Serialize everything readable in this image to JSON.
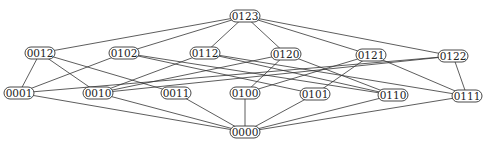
{
  "diagram": {
    "type": "hasse-diagram",
    "nodes": [
      {
        "id": "0123",
        "label": "0123",
        "x": 245,
        "y": 16
      },
      {
        "id": "0012",
        "label": "0012",
        "x": 40,
        "y": 53
      },
      {
        "id": "0102",
        "label": "0102",
        "x": 124,
        "y": 53
      },
      {
        "id": "0112",
        "label": "0112",
        "x": 205,
        "y": 53
      },
      {
        "id": "0120",
        "label": "0120",
        "x": 286,
        "y": 54
      },
      {
        "id": "0121",
        "label": "0121",
        "x": 371,
        "y": 55
      },
      {
        "id": "0122",
        "label": "0122",
        "x": 453,
        "y": 56
      },
      {
        "id": "0001",
        "label": "0001",
        "x": 19,
        "y": 93
      },
      {
        "id": "0010",
        "label": "0010",
        "x": 98,
        "y": 93
      },
      {
        "id": "0011",
        "label": "0011",
        "x": 176,
        "y": 93
      },
      {
        "id": "0100",
        "label": "0100",
        "x": 245,
        "y": 93
      },
      {
        "id": "0101",
        "label": "0101",
        "x": 315,
        "y": 94
      },
      {
        "id": "0110",
        "label": "0110",
        "x": 393,
        "y": 95
      },
      {
        "id": "0111",
        "label": "0111",
        "x": 467,
        "y": 96
      },
      {
        "id": "0000",
        "label": "0000",
        "x": 245,
        "y": 132
      }
    ],
    "edges": [
      [
        "0123",
        "0012"
      ],
      [
        "0123",
        "0102"
      ],
      [
        "0123",
        "0112"
      ],
      [
        "0123",
        "0120"
      ],
      [
        "0123",
        "0121"
      ],
      [
        "0123",
        "0122"
      ],
      [
        "0012",
        "0001"
      ],
      [
        "0012",
        "0010"
      ],
      [
        "0012",
        "0011"
      ],
      [
        "0102",
        "0001"
      ],
      [
        "0102",
        "0101"
      ],
      [
        "0102",
        "0110"
      ],
      [
        "0112",
        "0010"
      ],
      [
        "0112",
        "0110"
      ],
      [
        "0112",
        "0111"
      ],
      [
        "0120",
        "0010"
      ],
      [
        "0120",
        "0100"
      ],
      [
        "0120",
        "0110"
      ],
      [
        "0121",
        "0100"
      ],
      [
        "0121",
        "0101"
      ],
      [
        "0121",
        "0111"
      ],
      [
        "0122",
        "0001"
      ],
      [
        "0122",
        "0010"
      ],
      [
        "0122",
        "0111"
      ],
      [
        "0001",
        "0000"
      ],
      [
        "0010",
        "0000"
      ],
      [
        "0011",
        "0000"
      ],
      [
        "0100",
        "0000"
      ],
      [
        "0101",
        "0000"
      ],
      [
        "0110",
        "0000"
      ],
      [
        "0111",
        "0000"
      ]
    ]
  }
}
